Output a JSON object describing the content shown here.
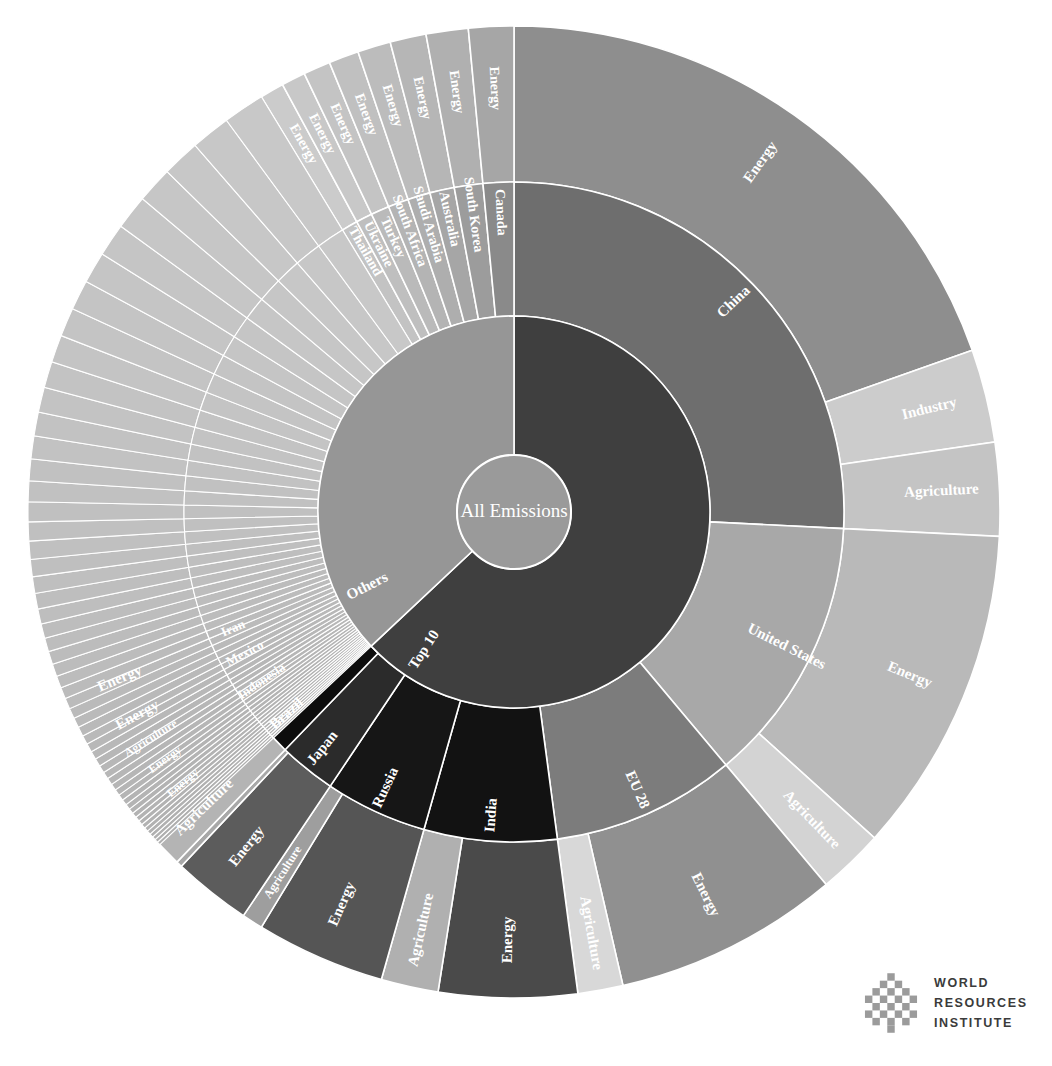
{
  "chart_data": {
    "type": "pie",
    "title": "All Emissions",
    "subtitle": "",
    "xlabel": "",
    "ylabel": "",
    "legend_position": "none",
    "grid": false,
    "center_label": "All Emissions",
    "rings": [
      "group",
      "country",
      "sector"
    ],
    "colors": {
      "center": "#9a9a9a",
      "top10": "#3f3f3f",
      "others": "#969696",
      "china": "#6e6e6e",
      "china_energy": "#8e8e8e",
      "china_industry": "#cccccc",
      "china_agriculture": "#c4c4c4",
      "united_states": "#a8a8a8",
      "us_energy": "#b9b9b9",
      "us_agriculture": "#d3d3d3",
      "eu28": "#7c7c7c",
      "eu_energy": "#909090",
      "eu_agriculture": "#d8d8d8",
      "india": "#121212",
      "india_energy": "#4a4a4a",
      "india_agriculture": "#b0b0b0",
      "russia": "#161616",
      "russia_energy": "#555555",
      "russia_agriculture": "#9e9e9e",
      "japan": "#2b2b2b",
      "brazil": "#0d0d0d",
      "indonesia": "#101010",
      "mexico": "#5e5e5e",
      "iran": "#747474",
      "canada": "#8a8a8a",
      "south_korea": "#9c9c9c",
      "australia": "#a6a6a6",
      "saudi_arabia": "#aeaeae",
      "south_africa": "#b4b4b4",
      "turkey": "#bababa",
      "ukraine": "#bfbfbf",
      "thailand": "#c3c3c3",
      "tail": "#b7b7b7",
      "text": "#ffffff",
      "background": "#ffffff"
    },
    "center": {
      "label": "All Emissions"
    },
    "ring1": [
      {
        "label": "Top 10",
        "value": 63.0,
        "color": "#3f3f3f"
      },
      {
        "label": "Others",
        "value": 37.0,
        "color": "#969696"
      }
    ],
    "top10_countries": [
      {
        "label": "China",
        "value": 25.8,
        "color": "#6e6e6e",
        "sectors": [
          {
            "label": "Energy",
            "value": 19.6,
            "color": "#8e8e8e"
          },
          {
            "label": "Industry",
            "value": 3.1,
            "color": "#cccccc"
          },
          {
            "label": "Agriculture",
            "value": 3.1,
            "color": "#c4c4c4"
          }
        ]
      },
      {
        "label": "United States",
        "value": 13.1,
        "color": "#a8a8a8",
        "sectors": [
          {
            "label": "Energy",
            "value": 10.9,
            "color": "#b9b9b9"
          },
          {
            "label": "Agriculture",
            "value": 2.2,
            "color": "#d3d3d3"
          }
        ]
      },
      {
        "label": "EU 28",
        "value": 9.0,
        "color": "#7c7c7c",
        "sectors": [
          {
            "label": "Energy",
            "value": 7.5,
            "color": "#909090"
          },
          {
            "label": "Agriculture",
            "value": 1.5,
            "color": "#d8d8d8"
          }
        ]
      },
      {
        "label": "India",
        "value": 6.5,
        "color": "#121212",
        "sectors": [
          {
            "label": "Energy",
            "value": 4.6,
            "color": "#4a4a4a"
          },
          {
            "label": "Agriculture",
            "value": 1.9,
            "color": "#b0b0b0"
          }
        ]
      },
      {
        "label": "Russia",
        "value": 5.0,
        "color": "#161616",
        "sectors": [
          {
            "label": "Energy",
            "value": 4.3,
            "color": "#555555"
          },
          {
            "label": "Agriculture",
            "value": 0.7,
            "color": "#9e9e9e"
          }
        ]
      },
      {
        "label": "Japan",
        "value": 2.8,
        "color": "#2b2b2b",
        "sectors": [
          {
            "label": "Energy",
            "value": 2.6,
            "color": "#5c5c5c"
          },
          {
            "label": "Agriculture",
            "value": 0.2,
            "color": "#a8a8a8"
          }
        ]
      },
      {
        "label": "Brazil",
        "value": 2.4,
        "color": "#0d0d0d",
        "sectors": [
          {
            "label": "Agriculture",
            "value": 1.3,
            "color": "#b4b4b4"
          },
          {
            "label": "Energy",
            "value": 1.1,
            "color": "#5a5a5a"
          }
        ]
      },
      {
        "label": "Indonesia",
        "value": 1.9,
        "color": "#101010",
        "sectors": [
          {
            "label": "Energy",
            "value": 1.1,
            "color": "#6a6a6a"
          },
          {
            "label": "Agriculture",
            "value": 0.8,
            "color": "#b8b8b8"
          }
        ]
      },
      {
        "label": "Mexico",
        "value": 1.5,
        "color": "#5e5e5e",
        "sectors": [
          {
            "label": "Energy",
            "value": 1.2,
            "color": "#8a8a8a"
          },
          {
            "label": "Agriculture",
            "value": 0.3,
            "color": "#c0c0c0"
          }
        ]
      },
      {
        "label": "Iran",
        "value": 1.4,
        "color": "#747474",
        "sectors": [
          {
            "label": "Energy",
            "value": 1.2,
            "color": "#9a9a9a"
          },
          {
            "label": "Agriculture",
            "value": 0.2,
            "color": "#c6c6c6"
          }
        ]
      }
    ],
    "others_countries": [
      {
        "label": "Canada",
        "value": 1.5,
        "color": "#8a8a8a",
        "sectors": [
          {
            "label": "Energy",
            "value": 1.5,
            "color": "#a6a6a6"
          }
        ]
      },
      {
        "label": "South Korea",
        "value": 1.4,
        "color": "#9c9c9c",
        "sectors": [
          {
            "label": "Energy",
            "value": 1.4,
            "color": "#b0b0b0"
          }
        ]
      },
      {
        "label": "Australia",
        "value": 1.2,
        "color": "#a6a6a6",
        "sectors": [
          {
            "label": "Energy",
            "value": 1.2,
            "color": "#b6b6b6"
          }
        ]
      },
      {
        "label": "Saudi Arabia",
        "value": 1.1,
        "color": "#aeaeae",
        "sectors": [
          {
            "label": "Energy",
            "value": 1.1,
            "color": "#bcbcbc"
          }
        ]
      },
      {
        "label": "South Africa",
        "value": 1.0,
        "color": "#b4b4b4",
        "sectors": [
          {
            "label": "Energy",
            "value": 1.0,
            "color": "#c0c0c0"
          }
        ]
      },
      {
        "label": "Turkey",
        "value": 0.9,
        "color": "#bababa",
        "sectors": [
          {
            "label": "Energy",
            "value": 0.9,
            "color": "#c4c4c4"
          }
        ]
      },
      {
        "label": "Ukraine",
        "value": 0.8,
        "color": "#bfbfbf",
        "sectors": [
          {
            "label": "Energy",
            "value": 0.8,
            "color": "#c8c8c8"
          }
        ]
      },
      {
        "label": "Thailand",
        "value": 0.8,
        "color": "#c3c3c3",
        "sectors": [
          {
            "label": "Energy",
            "value": 0.8,
            "color": "#cbcbcb"
          }
        ]
      }
    ],
    "others_tail_count": 56,
    "others_tail_value": 28.3,
    "annotations": [
      "All Emissions",
      "Top 10",
      "Others",
      "China",
      "Energy",
      "Industry",
      "Agriculture",
      "United States",
      "EU 28",
      "India",
      "Russia",
      "Japan",
      "Brazil",
      "Indonesia",
      "Mexico",
      "Iran",
      "Canada",
      "South Korea",
      "Australia",
      "Saudi Arabia",
      "South Africa",
      "Turkey",
      "Ukraine",
      "Thailand"
    ]
  },
  "logo": {
    "line1": "WORLD",
    "line2": "RESOURCES",
    "line3": "INSTITUTE",
    "mark": "woven-knot-mark"
  }
}
